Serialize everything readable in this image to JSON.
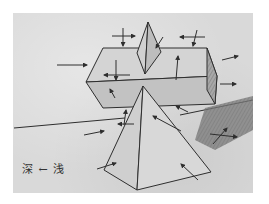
{
  "image": {
    "description": "Pencil sketch of light and shadow on geometric solids: a rectangular box resting on a pyramid, with a small double-pyramid on top, arrows indicating light direction",
    "paper_color": "#d9d9d9",
    "line_color": "#2e2e2e",
    "shadow_color": "#6e6e6e"
  },
  "annotation": {
    "text": "深 ← 浅",
    "deep": "深",
    "arrow": "←",
    "shallow": "浅"
  }
}
